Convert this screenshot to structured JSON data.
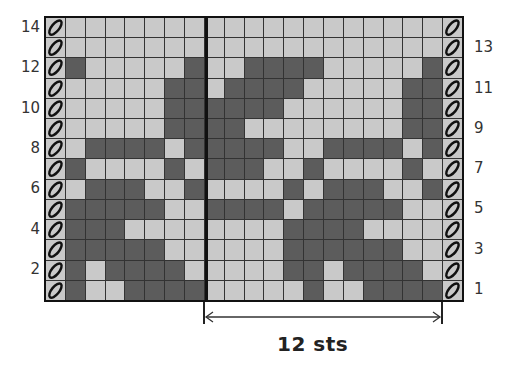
{
  "chart_data": {
    "type": "table",
    "title": "",
    "subtitle": "Knitting colorwork chart",
    "rows": 14,
    "pattern_columns": 19,
    "edge_columns": {
      "left": "edge-stitch",
      "right": "edge-stitch"
    },
    "legend": {
      "L": "light background (#c9c9c9)",
      "D": "dark contrast (#5c5c5c)",
      "edge": "slipped/edge stitch (hatched)"
    },
    "repeat": {
      "label": "12 sts",
      "start_column": 8,
      "end_column": 19
    },
    "grid_rows_top_to_bottom": [
      {
        "row": 14,
        "cells": "LLLLLLLLLLLLLLLLLLL"
      },
      {
        "row": 13,
        "cells": "LLLLLLLLLLLLLLLLLLL"
      },
      {
        "row": 12,
        "cells": "DLLLLLDLLDDDDLLLLLD"
      },
      {
        "row": 11,
        "cells": "LLLLLDDLDDDDLLLLLDD"
      },
      {
        "row": 10,
        "cells": "LLLLLDDDDDDLLLLLLDD"
      },
      {
        "row": 9,
        "cells": "LLLLLDDDDLLLLLLLLDD"
      },
      {
        "row": 8,
        "cells": "LDDDDLDDDDDLLDDDDLD"
      },
      {
        "row": 7,
        "cells": "DLLLLDLDDDLLDLLLLDL"
      },
      {
        "row": 6,
        "cells": "LDDDLLDLLLLDLDDDLLD"
      },
      {
        "row": 5,
        "cells": "DDDDDLLDDDDLDDDDDLL"
      },
      {
        "row": 4,
        "cells": "DDDLLLLLLLLDDDDLLLL"
      },
      {
        "row": 3,
        "cells": "DDDDDLLLLLLDDDDDDLL"
      },
      {
        "row": 2,
        "cells": "DLDDDDLLLLLDDLDDDDL"
      },
      {
        "row": 1,
        "cells": "DLLDDDDLLLLLDLLDDDD"
      }
    ],
    "left_axis_labels": [
      "14",
      "12",
      "10",
      "8",
      "6",
      "4",
      "2"
    ],
    "right_axis_labels": [
      "13",
      "11",
      "9",
      "7",
      "5",
      "3",
      "1"
    ]
  },
  "colors": {
    "light": "#c9c9c9",
    "dark": "#5c5c5c",
    "border": "#111111",
    "gridline": "#333333"
  },
  "labels": {
    "left": [
      {
        "text": "14",
        "row": 14
      },
      {
        "text": "12",
        "row": 12
      },
      {
        "text": "10",
        "row": 10
      },
      {
        "text": "8",
        "row": 8
      },
      {
        "text": "6",
        "row": 6
      },
      {
        "text": "4",
        "row": 4
      },
      {
        "text": "2",
        "row": 2
      }
    ],
    "right": [
      {
        "text": "13",
        "row": 13
      },
      {
        "text": "11",
        "row": 11
      },
      {
        "text": "9",
        "row": 9
      },
      {
        "text": "7",
        "row": 7
      },
      {
        "text": "5",
        "row": 5
      },
      {
        "text": "3",
        "row": 3
      },
      {
        "text": "1",
        "row": 1
      }
    ],
    "repeat": "12 sts"
  }
}
